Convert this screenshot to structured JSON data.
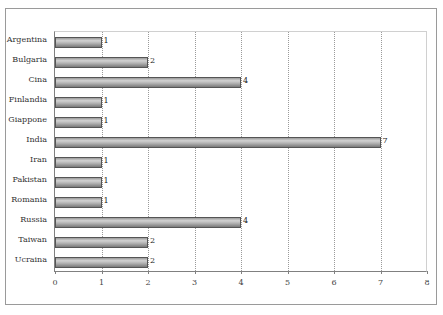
{
  "chart_data": {
    "type": "bar",
    "orientation": "horizontal",
    "title": "",
    "xlabel": "",
    "ylabel": "",
    "categories": [
      "Argentina",
      "Bulgaria",
      "Cina",
      "Finlandia",
      "Giappone",
      "India",
      "Iran",
      "Pakistan",
      "Romania",
      "Russia",
      "Taiwan",
      "Ucraina"
    ],
    "values": [
      1,
      2,
      4,
      1,
      1,
      7,
      1,
      1,
      1,
      4,
      2,
      2
    ],
    "data_labels": [
      "1",
      "2",
      "4",
      "1",
      "1",
      "7",
      "1",
      "1",
      "1",
      "4",
      "2",
      "2"
    ],
    "xlim": [
      0,
      8
    ],
    "x_ticks": [
      "0",
      "1",
      "2",
      "3",
      "4",
      "5",
      "6",
      "7",
      "8"
    ],
    "grid": "vertical dotted",
    "legend": "none",
    "bar_color": "#b0b0b0"
  },
  "chart": {
    "rows": [
      {
        "label": "Argentina",
        "value": 1,
        "value_label": "1"
      },
      {
        "label": "Bulgaria",
        "value": 2,
        "value_label": "2"
      },
      {
        "label": "Cina",
        "value": 4,
        "value_label": "4"
      },
      {
        "label": "Finlandia",
        "value": 1,
        "value_label": "1"
      },
      {
        "label": "Giappone",
        "value": 1,
        "value_label": "1"
      },
      {
        "label": "India",
        "value": 7,
        "value_label": "7"
      },
      {
        "label": "Iran",
        "value": 1,
        "value_label": "1"
      },
      {
        "label": "Pakistan",
        "value": 1,
        "value_label": "1"
      },
      {
        "label": "Romania",
        "value": 1,
        "value_label": "1"
      },
      {
        "label": "Russia",
        "value": 4,
        "value_label": "4"
      },
      {
        "label": "Taiwan",
        "value": 2,
        "value_label": "2"
      },
      {
        "label": "Ucraina",
        "value": 2,
        "value_label": "2"
      }
    ],
    "x_ticks": [
      "0",
      "1",
      "2",
      "3",
      "4",
      "5",
      "6",
      "7",
      "8"
    ],
    "x_max": 8
  }
}
